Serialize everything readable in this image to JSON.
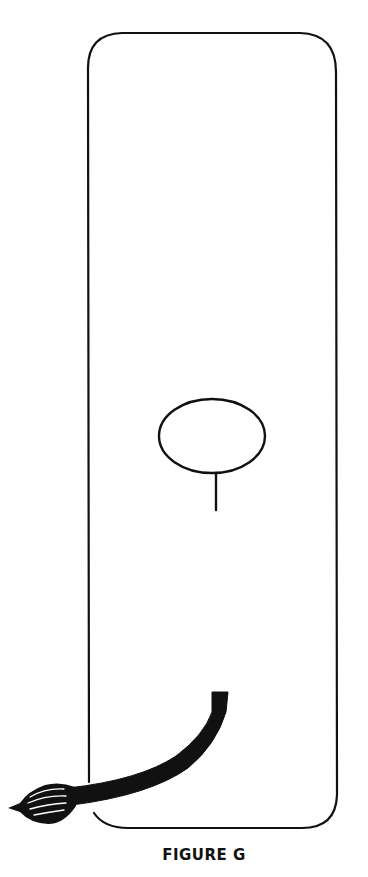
{
  "figure": {
    "caption": "FIGURE G",
    "stroke_color": "#111111",
    "background": "#ffffff",
    "elements": [
      {
        "type": "rounded-rectangle",
        "label": "canvas-outline"
      },
      {
        "type": "ellipse",
        "label": "oval-shape"
      },
      {
        "type": "line",
        "label": "stem-line"
      },
      {
        "type": "paintbrush",
        "label": "paintbrush"
      }
    ]
  }
}
